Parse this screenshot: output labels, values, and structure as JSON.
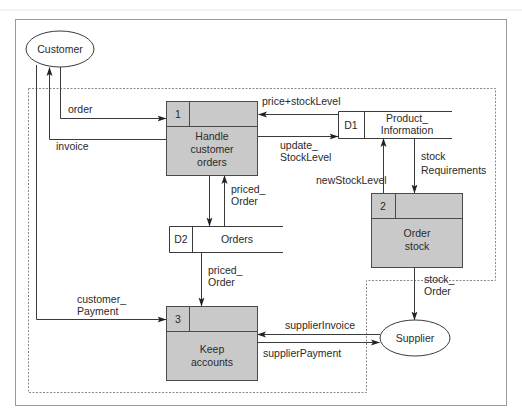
{
  "diagram": {
    "type": "data-flow-diagram",
    "external_entities": [
      {
        "id": "customer",
        "label": "Customer"
      },
      {
        "id": "supplier",
        "label": "Supplier"
      }
    ],
    "processes": [
      {
        "id": "p1",
        "number": "1",
        "label_lines": [
          "Handle",
          "customer",
          "orders"
        ]
      },
      {
        "id": "p2",
        "number": "2",
        "label_lines": [
          "Order",
          "stock"
        ]
      },
      {
        "id": "p3",
        "number": "3",
        "label_lines": [
          "Keep",
          "accounts"
        ]
      }
    ],
    "data_stores": [
      {
        "id": "d1",
        "code": "D1",
        "label_lines": [
          "Product_",
          "Information"
        ]
      },
      {
        "id": "d2",
        "code": "D2",
        "label_lines": [
          "Orders"
        ]
      }
    ],
    "flows": [
      {
        "from": "customer",
        "to": "p1",
        "label_lines": [
          "order"
        ]
      },
      {
        "from": "p1",
        "to": "customer",
        "label_lines": [
          "invoice"
        ]
      },
      {
        "from": "d1",
        "to": "p1",
        "label_lines": [
          "price+stockLevel"
        ]
      },
      {
        "from": "p1",
        "to": "d1",
        "label_lines": [
          "update_",
          "StockLevel"
        ]
      },
      {
        "from": "p1",
        "to": "d2",
        "label_lines": []
      },
      {
        "from": "d2",
        "to": "p1",
        "label_lines": [
          "priced_",
          "Order"
        ]
      },
      {
        "from": "d2",
        "to": "p3",
        "label_lines": [
          "priced_",
          "Order"
        ]
      },
      {
        "from": "customer",
        "to": "p3",
        "label_lines": [
          "customer_",
          "Payment"
        ]
      },
      {
        "from": "d1",
        "to": "p2",
        "label_lines": [
          "stock",
          "Requirements"
        ]
      },
      {
        "from": "p2",
        "to": "d1",
        "label_lines": [
          "newStockLevel"
        ]
      },
      {
        "from": "p2",
        "to": "supplier",
        "label_lines": [
          "stock_",
          "Order"
        ]
      },
      {
        "from": "supplier",
        "to": "p3",
        "label_lines": [
          "supplierInvoice"
        ]
      },
      {
        "from": "p3",
        "to": "supplier",
        "label_lines": [
          "supplierPayment"
        ]
      }
    ]
  },
  "colors": {
    "process_fill": "#c9c9c9",
    "line": "#3a3a3a",
    "frame": "#9a9a9a",
    "background": "#ffffff"
  }
}
